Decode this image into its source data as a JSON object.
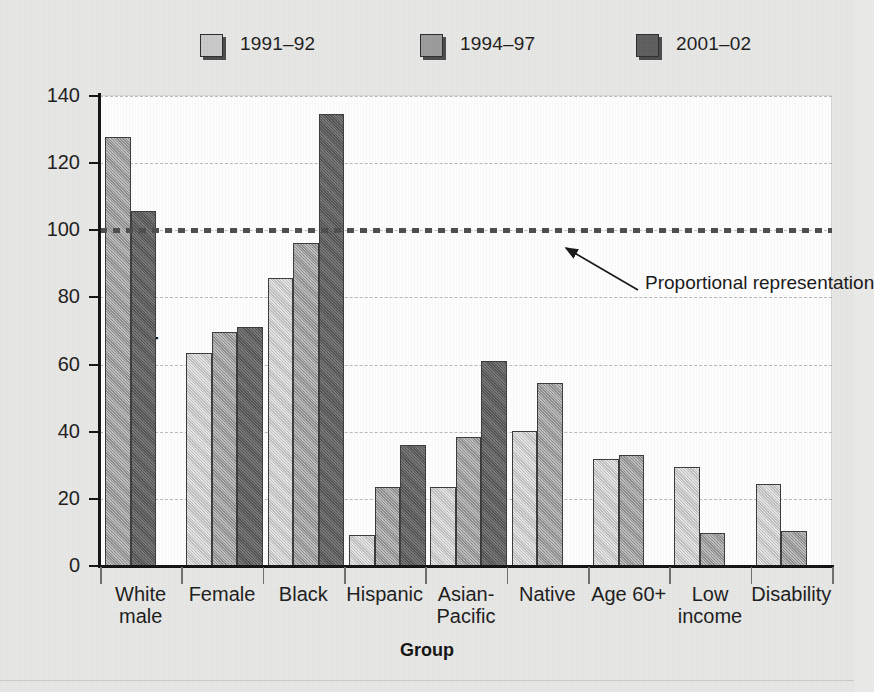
{
  "chart_data": {
    "type": "bar",
    "title": "",
    "xlabel": "Group",
    "ylabel": "Percent representation",
    "ylim": [
      0,
      140
    ],
    "ytick_step": 20,
    "yticks": [
      0,
      20,
      40,
      60,
      80,
      100,
      120,
      140
    ],
    "grid": true,
    "legend_position": "top",
    "categories": [
      "White\nmale",
      "Female",
      "Black",
      "Hispanic",
      "Asian-\nPacific",
      "Native",
      "Age 60+",
      "Low\nincome",
      "Disability"
    ],
    "series": [
      {
        "name": "1991–92",
        "color": "#cacaca",
        "values": [
          null,
          63.3,
          85.7,
          9.2,
          23.4,
          40.1,
          32.0,
          29.6,
          24.4
        ]
      },
      {
        "name": "1994–97",
        "color": "#9b9b9b",
        "values": [
          127.7,
          69.6,
          96.1,
          23.5,
          38.3,
          54.6,
          33.1,
          9.8,
          10.5
        ]
      },
      {
        "name": "2001–02",
        "color": "#5d5d5d",
        "values": [
          105.8,
          71.1,
          134.7,
          36.0,
          61.0,
          null,
          null,
          null,
          null
        ]
      }
    ],
    "reference_line": {
      "value": 100,
      "label": "Proportional representation",
      "style": "dotted",
      "color": "#4c4c4c"
    },
    "annotations": [
      {
        "text": "Proportional representation",
        "points_to": 100
      }
    ]
  },
  "legend": {
    "items": [
      {
        "label": "1991–92",
        "swatch": "legend-swatch-light"
      },
      {
        "label": "1994–97",
        "swatch": "legend-swatch-medium"
      },
      {
        "label": "2001–02",
        "swatch": "legend-swatch-dark"
      }
    ]
  },
  "axes": {
    "y_title": "Percent representation",
    "x_title": "Group",
    "y_tick_labels": [
      "140",
      "120",
      "100",
      "80",
      "60",
      "40",
      "20",
      "0"
    ]
  },
  "colors": {
    "series_light": "#cacaca",
    "series_medium": "#9b9b9b",
    "series_dark": "#5d5d5d",
    "axis": "#111111",
    "grid": "#b9b9b9",
    "plot_background": "#ffffff",
    "page_background": "#e8e8e6",
    "reference_line": "#4c4c4c"
  }
}
